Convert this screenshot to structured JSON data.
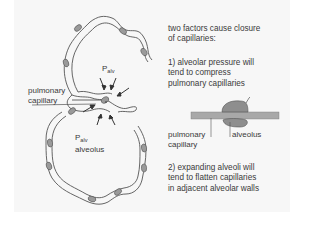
{
  "figure": {
    "left_labels": {
      "palv_top": {
        "symbol": "P",
        "subscript": "alv"
      },
      "pulmonary_capillary": [
        "pulmonary",
        "capillary"
      ],
      "palv_bottom": {
        "symbol": "P",
        "subscript": "alv"
      },
      "alveolus": "alveolus"
    },
    "right_text": {
      "intro": [
        "two factors cause closure",
        "of capillaries:"
      ],
      "factor1": [
        "1)  alveolar pressure will",
        "tend to compress",
        "pulmonary capillaries"
      ],
      "inset_labels": {
        "pulmonary_capillary": [
          "pulmonary",
          "capillary"
        ],
        "alveolus": "alveolus"
      },
      "factor2": [
        "2)  expanding alveoli will",
        "tend to flatten capillaries",
        "in adjacent alveolar walls"
      ]
    },
    "colors": {
      "panel_bg": "#f7f7f7",
      "wall_fill": "#f2f2f2",
      "line": "#555555",
      "nucleus": "#9a9a9a",
      "capillary_bar": "#a8a8a8",
      "alveolus_blob": "#8e8e8e"
    }
  }
}
